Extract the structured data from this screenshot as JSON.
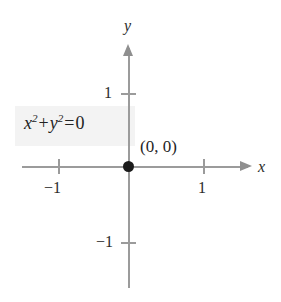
{
  "chart_data": {
    "type": "scatter",
    "title": "",
    "xlabel": "x",
    "ylabel": "y",
    "xlim": [
      -1.45,
      1.6
    ],
    "ylim": [
      -1.6,
      1.6
    ],
    "grid": false,
    "legend": null,
    "x_ticks": [
      "-1",
      "1"
    ],
    "x_tick_values": [
      -1,
      1
    ],
    "y_ticks": [
      "1",
      "-1"
    ],
    "y_tick_values": [
      1,
      -1
    ],
    "series": [
      {
        "name": "x^2 + y^2 = 0",
        "equation_display": "x2 + y2 = 0",
        "points": [
          [
            0,
            0
          ]
        ],
        "point_labels": [
          "(0, 0)"
        ],
        "color": "#1b1b1b"
      }
    ],
    "annotations": [
      {
        "text": "x2 + y2 = 0",
        "highlighted": true,
        "x": -0.78,
        "y": 0.42
      },
      {
        "text": "(0, 0)",
        "x": 0.2,
        "y": 0.22
      }
    ]
  },
  "graph": {
    "equation": {
      "var_x": "x",
      "exp_x": "2",
      "plus": "+",
      "var_y": "y",
      "exp_y": "2",
      "equals": "=",
      "rhs": "0"
    },
    "origin_label": "(0, 0)",
    "axis_x_name": "x",
    "axis_y_name": "y",
    "ticks": {
      "x_neg1": "−1",
      "x_pos1": "1",
      "y_pos1": "1",
      "y_neg1": "−1"
    }
  },
  "colors": {
    "axis": "#9b9b9b",
    "point": "#1b1b1b",
    "highlight": "#f3f3f3",
    "text": "#222222",
    "background": "#ffffff"
  }
}
